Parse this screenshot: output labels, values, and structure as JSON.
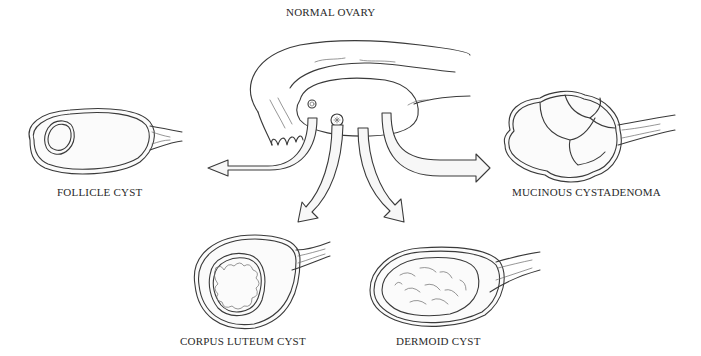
{
  "diagram": {
    "center": {
      "label": "NORMAL OVARY",
      "x": 286,
      "y": 14
    },
    "outcomes": [
      {
        "id": "follicle",
        "label": "FOLLICLE CYST",
        "x": 57,
        "y": 192
      },
      {
        "id": "mucinous",
        "label": "MUCINOUS CYSTADENOMA",
        "x": 512,
        "y": 192
      },
      {
        "id": "corpus-luteum",
        "label": "CORPUS LUTEUM CYST",
        "x": 180,
        "y": 341
      },
      {
        "id": "dermoid",
        "label": "DERMOID CYST",
        "x": 396,
        "y": 341
      }
    ],
    "arrows": [
      {
        "from": "normal-ovary",
        "to": "follicle"
      },
      {
        "from": "normal-ovary",
        "to": "mucinous"
      },
      {
        "from": "normal-ovary",
        "to": "corpus-luteum"
      },
      {
        "from": "normal-ovary",
        "to": "dermoid"
      }
    ],
    "colors": {
      "ink": "#3a3a3a",
      "paper": "#ffffff"
    }
  }
}
